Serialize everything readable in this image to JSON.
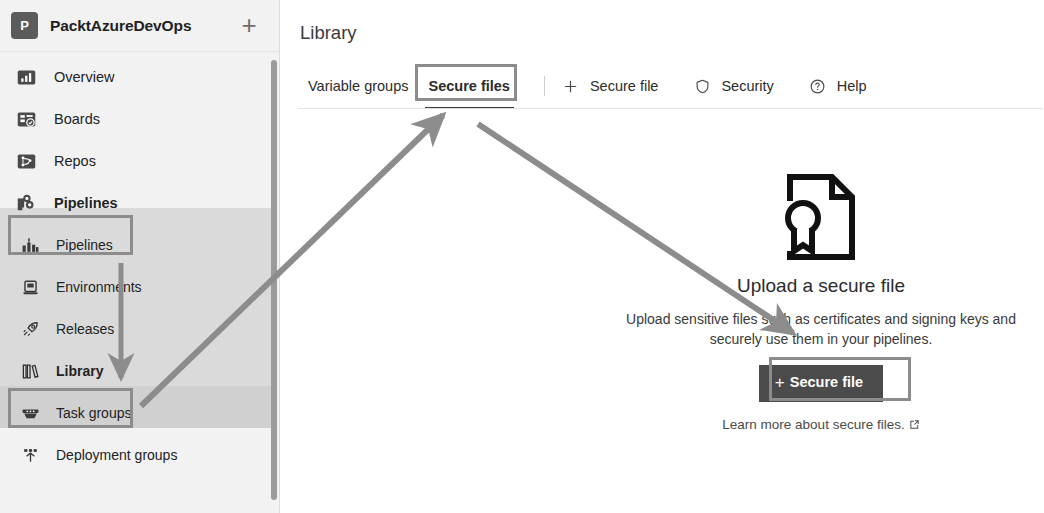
{
  "sidebar": {
    "project": {
      "initial": "P",
      "name": "PacktAzureDevOps",
      "new_label": "+"
    },
    "items": [
      {
        "label": "Overview",
        "icon": "overview-icon",
        "level": 1,
        "selected": false,
        "bold": false
      },
      {
        "label": "Boards",
        "icon": "boards-icon",
        "level": 1,
        "selected": false,
        "bold": false
      },
      {
        "label": "Repos",
        "icon": "repos-icon",
        "level": 1,
        "selected": false,
        "bold": false
      },
      {
        "label": "Pipelines",
        "icon": "pipelines-icon",
        "level": 1,
        "selected": true,
        "bold": true
      },
      {
        "label": "Pipelines",
        "icon": "pipelines-sub-icon",
        "level": 2,
        "selected": false,
        "bold": false
      },
      {
        "label": "Environments",
        "icon": "environments-icon",
        "level": 2,
        "selected": false,
        "bold": false
      },
      {
        "label": "Releases",
        "icon": "releases-icon",
        "level": 2,
        "selected": false,
        "bold": false
      },
      {
        "label": "Library",
        "icon": "library-icon",
        "level": 2,
        "selected": true,
        "bold": true
      },
      {
        "label": "Task groups",
        "icon": "task-groups-icon",
        "level": 2,
        "selected": false,
        "bold": false
      },
      {
        "label": "Deployment groups",
        "icon": "deployment-groups-icon",
        "level": 2,
        "selected": false,
        "bold": false
      }
    ]
  },
  "main": {
    "page_title": "Library",
    "tabs": [
      {
        "label": "Variable groups",
        "active": false
      },
      {
        "label": "Secure files",
        "active": true
      }
    ],
    "commands": [
      {
        "label": "Secure file",
        "icon": "plus-icon"
      },
      {
        "label": "Security",
        "icon": "shield-icon"
      },
      {
        "label": "Help",
        "icon": "question-circle-icon"
      }
    ],
    "empty_state": {
      "icon": "certificate-document-icon",
      "title": "Upload a secure file",
      "description": "Upload sensitive files such as certificates and signing keys and securely use them in your pipelines.",
      "button_label": "Secure file",
      "button_plus": "+",
      "learn_more": "Learn more about secure files.",
      "learn_more_icon": "external-link-icon"
    }
  },
  "annotations": {
    "boxes": [
      {
        "name": "pipelines-highlight"
      },
      {
        "name": "library-highlight"
      },
      {
        "name": "secure-files-tab-highlight"
      },
      {
        "name": "secure-file-button-highlight"
      }
    ],
    "arrows": [
      {
        "name": "library-to-secure-files-tab"
      },
      {
        "name": "tab-to-secure-file-button"
      },
      {
        "name": "pipelines-to-library-down"
      }
    ]
  },
  "colors": {
    "sidebar_bg": "#f2f2f2",
    "band_pipelines": "#dadada",
    "band_library": "#d0d0d0",
    "annotation": "#8c8c8c",
    "primary_button": "#4b4b4b",
    "text": "#232323"
  }
}
